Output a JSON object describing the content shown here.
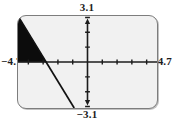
{
  "device": {
    "name": "graphing-calculator-screen",
    "screen_background": "#f1f1f1",
    "screen_border": "#7d7d7d"
  },
  "window_labels": {
    "ymax": "3.1",
    "ymin": "−3.1",
    "xmin": "−4.7",
    "xmax": "4.7"
  },
  "chart_data": {
    "type": "line",
    "title": "",
    "xlabel": "",
    "ylabel": "",
    "xlim": [
      -4.7,
      4.7
    ],
    "ylim": [
      -3.1,
      3.1
    ],
    "grid": false,
    "legend": null,
    "axis_color": "#1c1c1c",
    "tick_interval_x": 1,
    "tick_interval_y": 1,
    "x_ticks": [
      -4,
      -3,
      -2,
      -1,
      1,
      2,
      3,
      4
    ],
    "y_ticks": [
      -3,
      -2,
      -1,
      1,
      2,
      3
    ],
    "series": [
      {
        "name": "line",
        "type": "line",
        "color": "#111111",
        "x": [
          -4.7,
          -0.9
        ],
        "y": [
          3.1,
          -3.1
        ],
        "points": [
          {
            "x": -4.7,
            "y": 3.1
          },
          {
            "x": -0.9,
            "y": -3.1
          }
        ]
      }
    ],
    "shaded_regions": [
      {
        "name": "shaded-triangle",
        "fill": "#0c0c0c",
        "description": "filled triangle bounded by the line, the y-axis region to the left, the x-axis and the left window edge",
        "vertices": [
          {
            "x": -4.7,
            "y": 3.1
          },
          {
            "x": -2.8,
            "y": 0.0
          },
          {
            "x": -4.7,
            "y": 0.0
          }
        ]
      }
    ]
  }
}
